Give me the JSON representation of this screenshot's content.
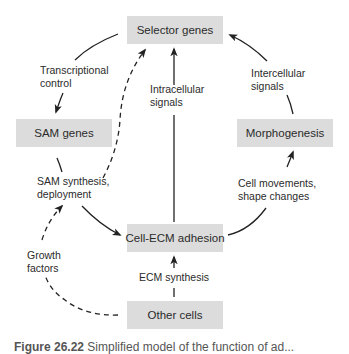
{
  "nodes": {
    "selector_genes": "Selector genes",
    "sam_genes": "SAM genes",
    "morphogenesis": "Morphogenesis",
    "cell_ecm_adhesion": "Cell-ECM adhesion",
    "other_cells": "Other cells"
  },
  "edge_labels": {
    "transcriptional_control": [
      "Transcriptional",
      "control"
    ],
    "intracellular_signals": [
      "Intracellular",
      "signals"
    ],
    "intercellular_signals": [
      "Intercellular",
      "signals"
    ],
    "sam_synthesis": [
      "SAM synthesis,",
      "deployment"
    ],
    "cell_movements": [
      "Cell movements,",
      "shape changes"
    ],
    "growth_factors": [
      "Growth",
      "factors"
    ],
    "ecm_synthesis": "ECM synthesis"
  },
  "caption": {
    "figure_number": "Figure 26.22",
    "text": " Simplified model of the function of ad..."
  },
  "colors": {
    "box_fill": "#dcdcdc",
    "line": "#222222"
  }
}
